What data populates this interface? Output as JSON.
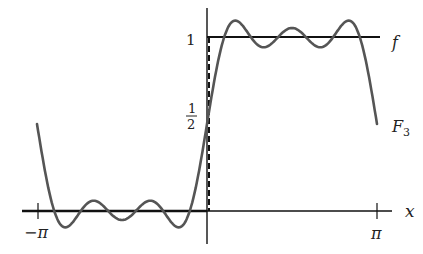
{
  "chart_data": {
    "type": "line",
    "title": "",
    "xlabel": "x",
    "ylabel": "",
    "xlim": [
      -3.1416,
      3.1416
    ],
    "ylim": [
      -0.15,
      1.15
    ],
    "grid": false,
    "x_ticks": [
      {
        "value": -3.1416,
        "label": "−π"
      },
      {
        "value": 3.1416,
        "label": "π"
      }
    ],
    "y_ticks": [
      {
        "value": 1,
        "label": "1"
      },
      {
        "value": 0.5,
        "label": "½"
      }
    ],
    "series": [
      {
        "name": "f",
        "label": "f",
        "description": "square wave: 0 on (−π,0), 1 on (0,π), jump at x=0 (dashed)",
        "x": [
          -3.1416,
          0,
          0,
          3.1416
        ],
        "values": [
          0,
          0,
          1,
          1
        ]
      },
      {
        "name": "F3",
        "label": "F₃",
        "description": "partial Fourier sum 1/2 + (2/π)(sin x + sin3x/3 + sin5x/5)",
        "x": [
          -3.1416,
          -2.618,
          -2.094,
          -1.571,
          -1.047,
          -0.524,
          0,
          0.524,
          1.047,
          1.571,
          2.094,
          2.618,
          3.1416
        ],
        "values": [
          0.5,
          -0.07,
          0.02,
          -0.07,
          0.06,
          -0.02,
          0.5,
          1.02,
          0.94,
          1.07,
          0.94,
          1.07,
          0.5
        ]
      }
    ],
    "annotations": [
      {
        "text": "f",
        "near": "right end of f at y=1"
      },
      {
        "text": "F₃",
        "near": "right end of F₃"
      }
    ]
  },
  "labels": {
    "x_axis": "x",
    "tick_neg_pi": "−π",
    "tick_pi": "π",
    "tick_one": "1",
    "half_num": "1",
    "half_den": "2",
    "f_label": "f",
    "F_label": "F",
    "F_sub": "3"
  },
  "colors": {
    "axis": "#111111",
    "f": "#111111",
    "F3": "#555555"
  }
}
